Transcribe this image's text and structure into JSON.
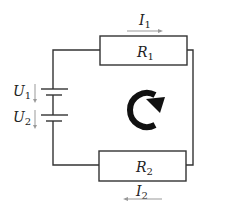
{
  "diagram": {
    "type": "series circuit",
    "components": {
      "resistor_top": {
        "label": "R",
        "subscript": "1"
      },
      "resistor_bottom": {
        "label": "R",
        "subscript": "2"
      },
      "source_top": {
        "label": "U",
        "subscript": "1"
      },
      "source_bottom": {
        "label": "U",
        "subscript": "2"
      }
    },
    "currents": {
      "top": {
        "label": "I",
        "subscript": "1",
        "direction": "right"
      },
      "bottom": {
        "label": "I",
        "subscript": "2",
        "direction": "left"
      }
    },
    "loop_direction": "clockwise",
    "colors": {
      "wire": "#333333",
      "arrow": "#999999",
      "loop": "#111111"
    }
  }
}
